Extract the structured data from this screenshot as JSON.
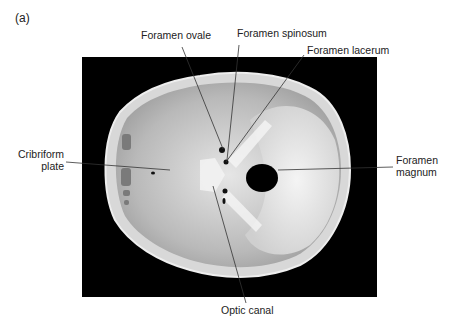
{
  "figure": {
    "panel_label": "(a)",
    "labels": {
      "foramen_ovale": "Foramen ovale",
      "foramen_spinosum": "Foramen spinosum",
      "foramen_lacerum": "Foramen lacerum",
      "cribriform_plate_line1": "Cribriform",
      "cribriform_plate_line2": "plate",
      "foramen_magnum_line1": "Foramen",
      "foramen_magnum_line2": "magnum",
      "optic_canal": "Optic canal"
    }
  }
}
